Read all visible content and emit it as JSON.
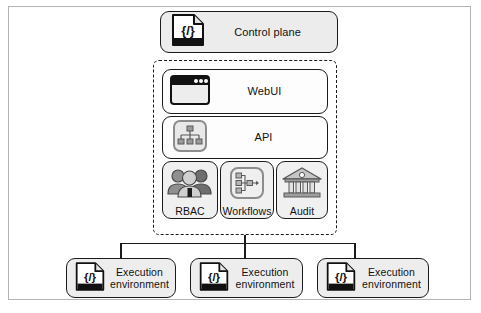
{
  "diagram": {
    "control_plane": {
      "label": "Control plane",
      "icon": "code-document-icon",
      "icon_glyph": "{/}"
    },
    "group": {
      "name": "control-plane-components",
      "border_style": "dashed",
      "components": [
        {
          "label": "WebUI",
          "icon": "browser-window-icon"
        },
        {
          "label": "API",
          "icon": "hierarchy-chart-icon"
        }
      ],
      "services": [
        {
          "label": "RBAC",
          "icon": "user-group-icon"
        },
        {
          "label": "Workflows",
          "icon": "flowchart-icon"
        },
        {
          "label": "Audit",
          "icon": "bank-building-icon"
        }
      ]
    },
    "execution_environments": [
      {
        "label": "Execution\nenvironment",
        "line1": "Execution",
        "line2": "environment",
        "icon": "code-document-icon",
        "icon_glyph": "{/}"
      },
      {
        "label": "Execution\nenvironment",
        "line1": "Execution",
        "line2": "environment",
        "icon": "code-document-icon",
        "icon_glyph": "{/}"
      },
      {
        "label": "Execution\nenvironment",
        "line1": "Execution",
        "line2": "environment",
        "icon": "code-document-icon",
        "icon_glyph": "{/}"
      }
    ],
    "colors": {
      "stroke": "#1b1b1b",
      "node_fill": "#eeeeee",
      "inner_fill": "#fdfdfd",
      "frame": "#b4b4b4",
      "background": "#ffffff"
    }
  }
}
